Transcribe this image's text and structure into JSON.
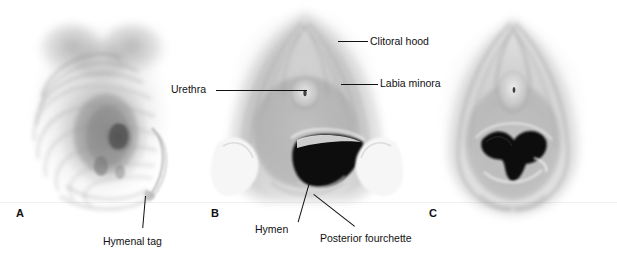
{
  "figure": {
    "background_color": "#ffffff",
    "ink_color": "#111111",
    "panel_count": 3
  },
  "panels": [
    {
      "letter": "A",
      "name": "panel-a",
      "description": "Annular / redundant hymen with hymenal tag, oblique view",
      "letter_x": 16,
      "letter_y": 208
    },
    {
      "letter": "B",
      "name": "panel-b",
      "description": "Crescentic hymen with visible vaginal opening, labia retracted",
      "letter_x": 211,
      "letter_y": 208
    },
    {
      "letter": "C",
      "name": "panel-c",
      "description": "Hymen with irregular central opening",
      "letter_x": 429,
      "letter_y": 208
    }
  ],
  "callouts": [
    {
      "id": "clitoral-hood",
      "text": "Clitoral hood",
      "label_x": 370,
      "label_y": 36,
      "line_x": 338,
      "line_y": 41,
      "line_len": 30,
      "line_angle": 0
    },
    {
      "id": "labia-minora",
      "text": "Labia minora",
      "label_x": 380,
      "label_y": 78,
      "line_x": 341,
      "line_y": 84,
      "line_len": 37,
      "line_angle": 0
    },
    {
      "id": "urethra",
      "text": "Urethra",
      "label_x": 171,
      "label_y": 84,
      "line_x": 216,
      "line_y": 90,
      "line_len": 91,
      "line_angle": 0
    },
    {
      "id": "hymenal-tag",
      "text": "Hymenal tag",
      "label_x": 103,
      "label_y": 236,
      "line_x": 146,
      "line_y": 196,
      "line_len": 32,
      "line_angle": 95
    },
    {
      "id": "hymen",
      "text": "Hymen",
      "label_x": 255,
      "label_y": 224,
      "line_x": 311,
      "line_y": 179,
      "line_len": 45,
      "line_angle": 106
    },
    {
      "id": "posterior-fourchette",
      "text": "Posterior fourchette",
      "label_x": 320,
      "label_y": 233,
      "line_x": 314,
      "line_y": 194,
      "line_len": 52,
      "line_angle": 38
    }
  ]
}
